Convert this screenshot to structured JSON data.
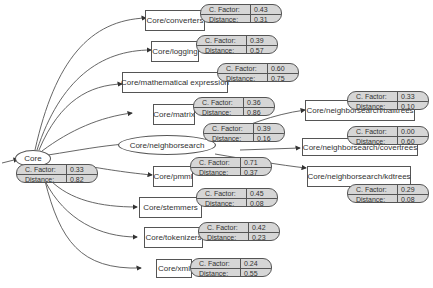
{
  "diagram": {
    "labels": {
      "factor": "C. Factor:",
      "distance": "Distance:"
    },
    "root": {
      "name": "Core",
      "factor": "0.33",
      "distance": "0.82"
    },
    "nodes": [
      {
        "name": "Core/converters",
        "factor": "0.43",
        "distance": "0.31"
      },
      {
        "name": "Core/logging",
        "factor": "0.39",
        "distance": "0.57"
      },
      {
        "name": "Core/mathematical expression",
        "factor": "0.60",
        "distance": "0.75"
      },
      {
        "name": "Core/matrix",
        "factor": "0.36",
        "distance": "0.86"
      },
      {
        "name": "Core/neighborsearch",
        "factor": "0.39",
        "distance": "0.16"
      },
      {
        "name": "Core/pmml",
        "factor": "0.71",
        "distance": "0.37"
      },
      {
        "name": "Core/stemmers",
        "factor": "0.45",
        "distance": "0.08"
      },
      {
        "name": "Core/tokenizers",
        "factor": "0.42",
        "distance": "0.23"
      },
      {
        "name": "Core/xml",
        "factor": "0.24",
        "distance": "0.55"
      },
      {
        "name": "Core/neighborsearch/balltrees",
        "factor": "0.33",
        "distance": "0.10"
      },
      {
        "name": "Core/neighborsearch/covertrees",
        "factor": "0.00",
        "distance": "0.60"
      },
      {
        "name": "Core/neighborsearch/kdtrees",
        "factor": "0.29",
        "distance": "0.08"
      }
    ]
  }
}
